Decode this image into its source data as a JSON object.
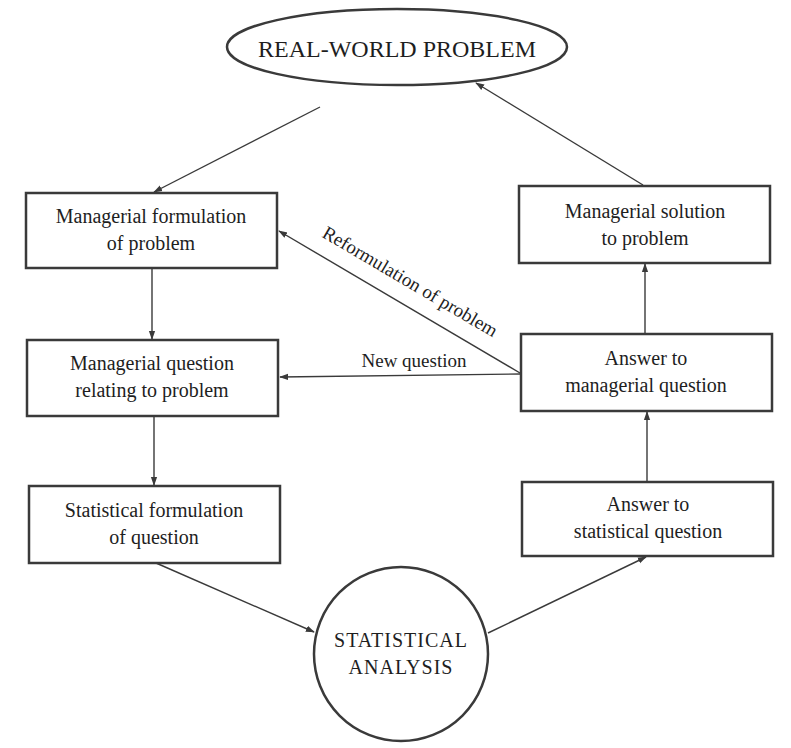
{
  "diagram": {
    "top_node": {
      "label": "REAL-WORLD PROBLEM"
    },
    "bottom_node": {
      "lines": [
        "STATISTICAL",
        "ANALYSIS"
      ]
    },
    "left_boxes": [
      {
        "lines": [
          "Managerial formulation",
          "of problem"
        ]
      },
      {
        "lines": [
          "Managerial question",
          "relating to problem"
        ]
      },
      {
        "lines": [
          "Statistical formulation",
          "of question"
        ]
      }
    ],
    "right_boxes": [
      {
        "lines": [
          "Managerial solution",
          "to problem"
        ]
      },
      {
        "lines": [
          "Answer to",
          "managerial question"
        ]
      },
      {
        "lines": [
          "Answer to",
          "statistical question"
        ]
      }
    ],
    "edge_labels": {
      "reformulation": "Reformulation of problem",
      "new_question": "New question"
    },
    "colors": {
      "stroke": "#3a3a3a",
      "text": "#1e1e1e",
      "background": "#ffffff"
    }
  }
}
